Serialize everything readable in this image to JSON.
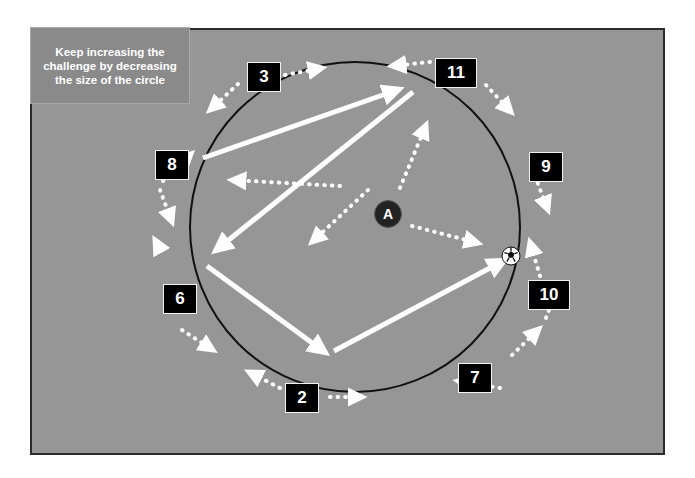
{
  "canvas": {
    "width": 695,
    "height": 478,
    "background": "#ffffff"
  },
  "pitch": {
    "fill": "#969696",
    "border_color": "#2b2b2b",
    "x": 30,
    "y": 28,
    "width": 635,
    "height": 427
  },
  "note": {
    "text": "Keep increasing the challenge by decreasing the size of the circle",
    "background": "#8a8a8a",
    "text_color": "#ffffff",
    "x": 30,
    "y": 27,
    "width": 160,
    "height": 77
  },
  "circle": {
    "label": "training-circle",
    "cx": 355,
    "cy": 227,
    "r": 165,
    "stroke": "#111111",
    "stroke_width": 2
  },
  "server": {
    "label": "A",
    "cx": 388,
    "cy": 214,
    "r": 14,
    "fill": "#232323",
    "text_color": "#ffffff"
  },
  "ball": {
    "cx": 511,
    "cy": 256,
    "r": 9
  },
  "markers": [
    {
      "label": "3",
      "x": 247,
      "y": 62,
      "w": 34,
      "h": 30
    },
    {
      "label": "11",
      "x": 435,
      "y": 58,
      "w": 42,
      "h": 30
    },
    {
      "label": "8",
      "x": 155,
      "y": 150,
      "w": 34,
      "h": 30
    },
    {
      "label": "9",
      "x": 529,
      "y": 152,
      "w": 34,
      "h": 30
    },
    {
      "label": "6",
      "x": 163,
      "y": 284,
      "w": 34,
      "h": 30
    },
    {
      "label": "10",
      "x": 528,
      "y": 280,
      "w": 42,
      "h": 30
    },
    {
      "label": "2",
      "x": 285,
      "y": 383,
      "w": 34,
      "h": 30
    },
    {
      "label": "7",
      "x": 458,
      "y": 363,
      "w": 34,
      "h": 30
    }
  ],
  "pass_arrows": [
    {
      "name": "pass-8-to-11",
      "x1": 203,
      "y1": 158,
      "x2": 400,
      "y2": 89
    },
    {
      "name": "pass-11-to-6",
      "x1": 413,
      "y1": 92,
      "x2": 215,
      "y2": 251
    },
    {
      "name": "pass-6-to-2",
      "x1": 207,
      "y1": 266,
      "x2": 326,
      "y2": 353
    },
    {
      "name": "pass-2-to-10",
      "x1": 334,
      "y1": 351,
      "x2": 505,
      "y2": 260
    }
  ],
  "run_arrows": [
    {
      "name": "run-centre-to-upper-left",
      "x1": 340,
      "y1": 186,
      "x2": 232,
      "y2": 180
    },
    {
      "name": "run-centre-to-lower-left",
      "x1": 368,
      "y1": 190,
      "x2": 312,
      "y2": 242
    },
    {
      "name": "run-centre-to-upper-right",
      "x1": 400,
      "y1": 188,
      "x2": 426,
      "y2": 125
    },
    {
      "name": "run-centre-to-right",
      "x1": 412,
      "y1": 226,
      "x2": 478,
      "y2": 243
    },
    {
      "name": "run-perimeter-top-left-out",
      "x1": 238,
      "y1": 84,
      "x2": 210,
      "y2": 110
    },
    {
      "name": "run-perimeter-top-left-in",
      "x1": 285,
      "y1": 75,
      "x2": 322,
      "y2": 68
    },
    {
      "name": "run-perimeter-top-right-in",
      "x1": 430,
      "y1": 62,
      "x2": 392,
      "y2": 66
    },
    {
      "name": "run-perimeter-top-right-out",
      "x1": 486,
      "y1": 85,
      "x2": 511,
      "y2": 112
    },
    {
      "name": "run-perimeter-left-up",
      "x1": 163,
      "y1": 181,
      "x2": 191,
      "y2": 154
    },
    {
      "name": "run-perimeter-left-down",
      "x1": 160,
      "y1": 190,
      "x2": 172,
      "y2": 222
    },
    {
      "name": "run-perimeter-right-down",
      "x1": 535,
      "y1": 176,
      "x2": 548,
      "y2": 210
    },
    {
      "name": "run-perimeter-right-up",
      "x1": 540,
      "y1": 276,
      "x2": 530,
      "y2": 242
    },
    {
      "name": "run-perimeter-lower-left-up",
      "x1": 161,
      "y1": 251,
      "x2": 155,
      "y2": 240
    },
    {
      "name": "run-perimeter-lower-left-down",
      "x1": 182,
      "y1": 330,
      "x2": 213,
      "y2": 350
    },
    {
      "name": "run-perimeter-bottom-left-in",
      "x1": 280,
      "y1": 388,
      "x2": 249,
      "y2": 372
    },
    {
      "name": "run-perimeter-bottom-left-out",
      "x1": 330,
      "y1": 397,
      "x2": 362,
      "y2": 397
    },
    {
      "name": "run-perimeter-bottom-right-in",
      "x1": 500,
      "y1": 388,
      "x2": 458,
      "y2": 381
    },
    {
      "name": "run-perimeter-bottom-right-out",
      "x1": 512,
      "y1": 355,
      "x2": 539,
      "y2": 329
    },
    {
      "name": "run-perimeter-right-lower",
      "x1": 546,
      "y1": 318,
      "x2": 556,
      "y2": 292
    }
  ]
}
